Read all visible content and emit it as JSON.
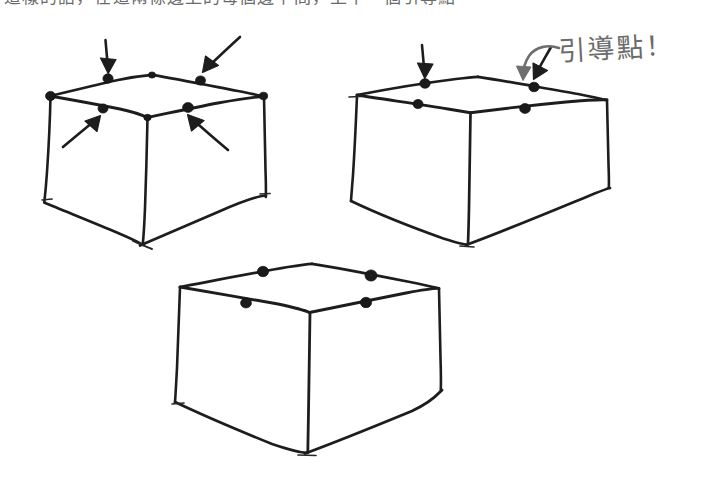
{
  "page": {
    "background_color": "#ffffff",
    "ink_color": "#1d1d1d",
    "note_ink_color": "#6e6e6e",
    "width": 706,
    "height": 497
  },
  "clipped_header": {
    "text": "這樣的話，在這兩條邊上的每個邊中間，上下一個引導點",
    "note": "top line of text is cropped off at the top edge of the image"
  },
  "annotation": {
    "text": "引導點！",
    "meaning_label": "guide point",
    "arrow": "curved-arrow-down-left",
    "color": "#6e6e6e"
  },
  "figures": [
    {
      "id": "box-1",
      "label": "box-with-four-arrows",
      "guide_dot_count": 6,
      "arrow_count": 4,
      "arrows": [
        {
          "name": "arrow-down-to-back-left-midpoint",
          "direction": "down"
        },
        {
          "name": "arrow-down-left-to-back-right-midpoint",
          "direction": "down-left"
        },
        {
          "name": "arrow-up-right-to-front-left-midpoint",
          "direction": "up-right"
        },
        {
          "name": "arrow-up-left-to-front-right-midpoint",
          "direction": "up-left"
        }
      ]
    },
    {
      "id": "box-2",
      "label": "box-with-two-arrows",
      "guide_dot_count": 4,
      "arrow_count": 2,
      "arrows": [
        {
          "name": "arrow-down-to-back-left-midpoint",
          "direction": "down"
        },
        {
          "name": "arrow-down-left-to-back-right-midpoint",
          "direction": "down-left"
        }
      ]
    },
    {
      "id": "box-3",
      "label": "box-plain-with-guide-dots",
      "guide_dot_count": 4,
      "arrow_count": 0,
      "arrows": []
    }
  ]
}
